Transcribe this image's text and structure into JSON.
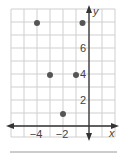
{
  "chart_data": {
    "type": "scatter",
    "title": "",
    "xlabel": "x",
    "ylabel": "y",
    "x_tick_labels": [
      "−4",
      "−2"
    ],
    "x_ticks": [
      -4,
      -2
    ],
    "y_tick_labels": [
      "2",
      "4",
      "6"
    ],
    "y_ticks": [
      2,
      4,
      6
    ],
    "xlim": [
      -6,
      2
    ],
    "ylim": [
      -1,
      9
    ],
    "grid": true,
    "legend": null,
    "series": [
      {
        "name": "points",
        "points": [
          {
            "x": -4,
            "y": 8
          },
          {
            "x": -0.5,
            "y": 8
          },
          {
            "x": -3,
            "y": 4
          },
          {
            "x": -1,
            "y": 4
          },
          {
            "x": -2,
            "y": 1
          }
        ]
      }
    ]
  },
  "colors": {
    "grid": "#cfcfcf",
    "axis": "#333333",
    "point": "#555555",
    "separator": "#9a9a9a"
  }
}
